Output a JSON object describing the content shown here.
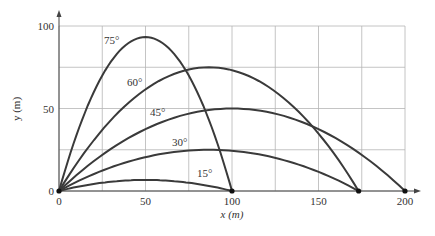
{
  "chart_data": {
    "type": "line",
    "title": "",
    "xlabel": "x (m)",
    "ylabel": "y (m)",
    "xlim": [
      0,
      200
    ],
    "ylim": [
      0,
      100
    ],
    "grid": true,
    "grid_step": 25,
    "x_ticks": [
      0,
      50,
      100,
      150,
      200
    ],
    "y_ticks": [
      0,
      50,
      100
    ],
    "legend": "none (inline labels)",
    "series": [
      {
        "name": "75°",
        "angle": 75,
        "range": 100,
        "max_height": 93.3,
        "x": [
          0,
          25,
          50,
          75,
          100
        ],
        "y": [
          0,
          70,
          93.3,
          70,
          0
        ],
        "label_pos": [
          104,
          44
        ]
      },
      {
        "name": "60°",
        "angle": 60,
        "range": 173.2,
        "max_height": 75,
        "x": [
          0,
          43.3,
          86.6,
          129.9,
          173.2
        ],
        "y": [
          0,
          56.25,
          75,
          56.25,
          0
        ],
        "label_pos": [
          127,
          86
        ]
      },
      {
        "name": "45°",
        "angle": 45,
        "range": 200,
        "max_height": 50,
        "x": [
          0,
          50,
          100,
          150,
          200
        ],
        "y": [
          0,
          37.5,
          50,
          37.5,
          0
        ],
        "label_pos": [
          150,
          116
        ]
      },
      {
        "name": "30°",
        "angle": 30,
        "range": 173.2,
        "max_height": 25,
        "x": [
          0,
          43.3,
          86.6,
          129.9,
          173.2
        ],
        "y": [
          0,
          18.75,
          25,
          18.75,
          0
        ],
        "label_pos": [
          172,
          146
        ]
      },
      {
        "name": "15°",
        "angle": 15,
        "range": 100,
        "max_height": 6.7,
        "x": [
          0,
          25,
          50,
          75,
          100
        ],
        "y": [
          0,
          5,
          6.7,
          5,
          0
        ],
        "label_pos": [
          197,
          177
        ]
      }
    ],
    "points": [
      {
        "x": 0,
        "y": 0
      },
      {
        "x": 100,
        "y": 0
      },
      {
        "x": 173.2,
        "y": 0
      },
      {
        "x": 200,
        "y": 0
      }
    ],
    "colors": {
      "curve": "#3a3a3a",
      "grid": "#b5b5b5",
      "axis": "#444444",
      "text": "#333333"
    }
  }
}
